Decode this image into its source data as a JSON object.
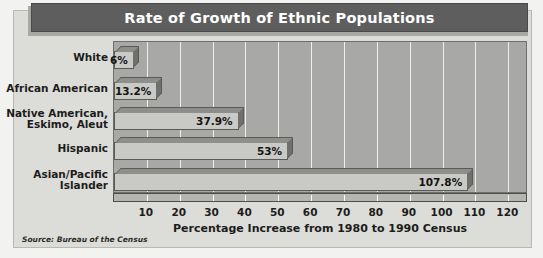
{
  "chart_data": {
    "type": "bar",
    "orientation": "horizontal",
    "title": "Rate of Growth of Ethnic Populations",
    "xlabel": "Percentage Increase from 1980 to 1990 Census",
    "ylabel": "",
    "categories": [
      "White",
      "African American",
      "Native American,\nEskimo, Aleut",
      "Hispanic",
      "Asian/Pacific\nIslander"
    ],
    "values": [
      6,
      13.2,
      37.9,
      53,
      107.8
    ],
    "value_labels": [
      "6%",
      "13.2%",
      "37.9%",
      "53%",
      "107.8%"
    ],
    "xlim": [
      0,
      126
    ],
    "xticks": [
      10,
      20,
      30,
      40,
      50,
      60,
      70,
      80,
      90,
      100,
      110,
      120
    ],
    "xtick_labels": [
      "10",
      "20",
      "30",
      "40",
      "50",
      "60",
      "70",
      "80",
      "90",
      "100",
      "110",
      "120"
    ],
    "grid": true,
    "gridlines_at": [
      10,
      20,
      30,
      40,
      50,
      60,
      70,
      80,
      90,
      100,
      110,
      120
    ],
    "legend": false,
    "source_note": "Source: Bureau of the Census",
    "colors": {
      "title_bar": "#5e5e5e",
      "title_text": "#ffffff",
      "plot_background": "#a8a8a6",
      "panel_background": "#dcdcd8",
      "bar_face": "#c9c9c5",
      "bar_top": "#8e8e8a",
      "bar_side": "#6f6f6c",
      "gridline": "#efefed",
      "text": "#1c1c1c"
    }
  }
}
